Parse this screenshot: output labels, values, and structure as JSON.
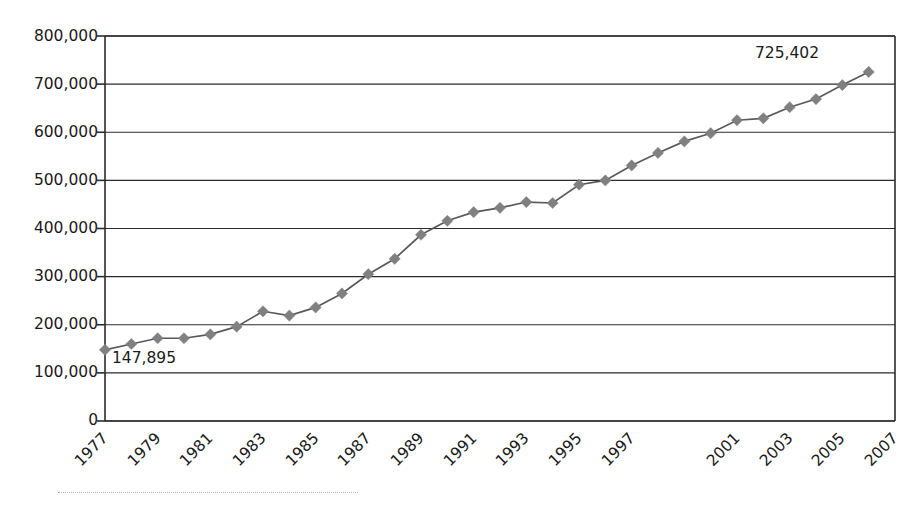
{
  "chart_data": {
    "type": "line",
    "title": "",
    "subtitle": "",
    "xlabel": "",
    "ylabel": "",
    "grid": true,
    "legend": "none",
    "xlim": [
      1977,
      2007
    ],
    "ylim": [
      0,
      800000
    ],
    "y_ticks": [
      0,
      100000,
      200000,
      300000,
      400000,
      500000,
      600000,
      700000,
      800000
    ],
    "y_tick_labels": [
      "0",
      "100,000",
      "200,000",
      "300,000",
      "400,000",
      "500,000",
      "600,000",
      "700,000",
      "800,000"
    ],
    "x_tick_labels": [
      "1977",
      "1979",
      "1981",
      "1983",
      "1985",
      "1987",
      "1989",
      "1991",
      "1993",
      "1995",
      "1997",
      "2001",
      "2003",
      "2005",
      "2007"
    ],
    "marker": "diamond",
    "series": [
      {
        "name": "series-1",
        "color": "#808080",
        "line_color": "#595959",
        "x": [
          1977,
          1978,
          1979,
          1980,
          1981,
          1982,
          1983,
          1984,
          1985,
          1986,
          1987,
          1988,
          1989,
          1990,
          1991,
          1992,
          1993,
          1994,
          1995,
          1996,
          1997,
          1998,
          1999,
          2000,
          2001,
          2002,
          2003,
          2004,
          2005,
          2006
        ],
        "values": [
          147895,
          160000,
          172000,
          172000,
          180000,
          196000,
          228000,
          219000,
          236000,
          265000,
          305000,
          337000,
          387000,
          416000,
          434000,
          443000,
          455000,
          453000,
          491000,
          500000,
          531000,
          557000,
          581000,
          598000,
          625000,
          629000,
          652000,
          669000,
          698000,
          725402
        ]
      }
    ],
    "annotations": [
      {
        "label": "147,895",
        "x": 1977,
        "y": 147895,
        "position": "below-right"
      },
      {
        "label": "725,402",
        "x": 2006,
        "y": 725402,
        "position": "above-left"
      }
    ]
  },
  "axis": {
    "y_labels": [
      "800,000",
      "700,000",
      "600,000",
      "500,000",
      "400,000",
      "300,000",
      "200,000",
      "100,000",
      "0"
    ],
    "x_labels": [
      "1977",
      "1979",
      "1981",
      "1983",
      "1985",
      "1987",
      "1989",
      "1991",
      "1993",
      "1995",
      "1997",
      "2001",
      "2003",
      "2005",
      "2007"
    ]
  },
  "annotations": {
    "start_value": "147,895",
    "end_value": "725,402"
  },
  "colors": {
    "marker": "#808080",
    "line": "#595959",
    "grid": "#2b2b2b",
    "axis": "#2b2b2b",
    "text": "#1a1a1a",
    "background": "#ffffff"
  }
}
